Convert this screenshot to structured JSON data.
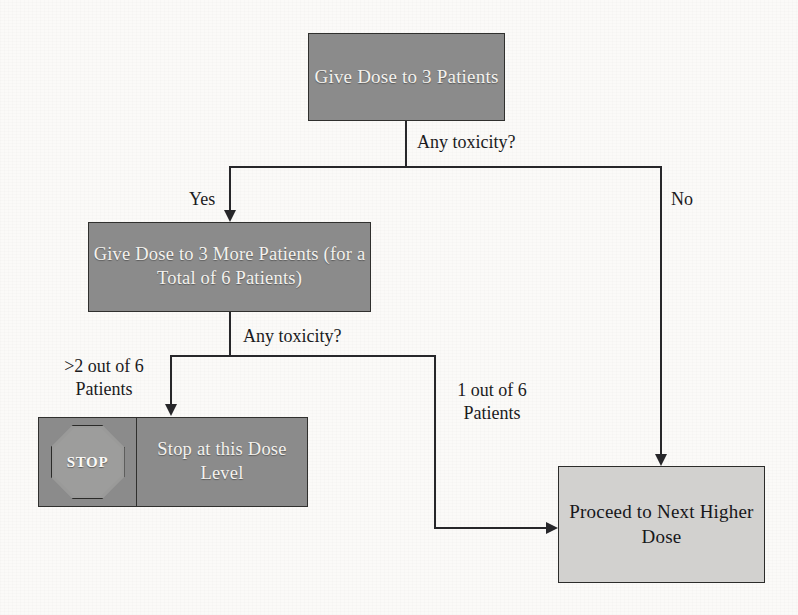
{
  "diagram": {
    "colors": {
      "node_dark_fill": "#8b8b8b",
      "node_light_fill": "#d2d1cf",
      "stroke": "#27272a",
      "dark_node_text": "#f4f2ee",
      "light_node_text": "#17171a",
      "background": "#fbfaf8"
    },
    "nodes": {
      "give_dose_3": {
        "label": "Give Dose to 3\nPatients",
        "style": "dark"
      },
      "give_dose_3_more": {
        "label": "Give Dose to 3 More\nPatients (for a Total of 6\nPatients)",
        "style": "dark"
      },
      "stop": {
        "sign_text": "STOP",
        "label": "Stop at this\nDose Level",
        "style": "dark"
      },
      "proceed": {
        "label": "Proceed to Next\nHigher Dose",
        "style": "light"
      }
    },
    "edge_labels": {
      "any_toxicity_1": "Any toxicity?",
      "yes": "Yes",
      "no": "No",
      "any_toxicity_2": "Any toxicity?",
      "more_than_2_of_6": ">2 out of 6\nPatients",
      "one_of_6": "1 out of 6\nPatients"
    }
  }
}
